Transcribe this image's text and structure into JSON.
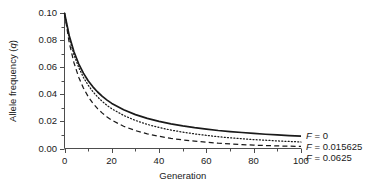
{
  "chart_data": {
    "type": "line",
    "title": "",
    "xlabel": "Generation",
    "ylabel": "Allele frequency (q)",
    "ylabel_prefix": "Allele frequency (",
    "ylabel_italic": "q",
    "ylabel_suffix": ")",
    "xlim": [
      0,
      100
    ],
    "ylim": [
      0.0,
      0.1
    ],
    "xticks": [
      0,
      20,
      40,
      60,
      80,
      100
    ],
    "xtick_labels": [
      "0",
      "20",
      "40",
      "60",
      "80",
      "100"
    ],
    "xminor_step": 10,
    "yticks": [
      0.0,
      0.02,
      0.04,
      0.06,
      0.08,
      0.1
    ],
    "ytick_labels": [
      "0.00",
      "0.02",
      "0.04",
      "0.06",
      "0.08",
      "0.10"
    ],
    "yminor_step": 0.01,
    "grid": false,
    "legend_position": "right-of-axes-at-curve-ends",
    "x": [
      0,
      2,
      4,
      6,
      8,
      10,
      12,
      14,
      16,
      18,
      20,
      25,
      30,
      35,
      40,
      45,
      50,
      55,
      60,
      65,
      70,
      75,
      80,
      85,
      90,
      95,
      100
    ],
    "series": [
      {
        "name": "F = 0",
        "label_prefix": "F",
        "label_rest": " = 0",
        "value": 0,
        "style": "solid",
        "color": "#1a1a1a",
        "values": [
          0.1,
          0.0833,
          0.0714,
          0.0625,
          0.0556,
          0.05,
          0.0455,
          0.0417,
          0.0385,
          0.0357,
          0.0333,
          0.0286,
          0.025,
          0.0222,
          0.02,
          0.0182,
          0.0167,
          0.0154,
          0.0143,
          0.0133,
          0.0125,
          0.0118,
          0.0111,
          0.0105,
          0.01,
          0.0095,
          0.0091
        ]
      },
      {
        "name": "F = 0.015625",
        "label_prefix": "F",
        "label_rest": " = 0.015625",
        "value": 0.015625,
        "style": "dotted",
        "color": "#1a1a1a",
        "values": [
          0.1,
          0.0819,
          0.0692,
          0.0598,
          0.0525,
          0.0467,
          0.042,
          0.038,
          0.0347,
          0.0318,
          0.0293,
          0.0244,
          0.0207,
          0.0178,
          0.0155,
          0.0136,
          0.0121,
          0.0108,
          0.0097,
          0.0087,
          0.0079,
          0.0072,
          0.0066,
          0.0061,
          0.0056,
          0.0052,
          0.0048
        ]
      },
      {
        "name": "F = 0.0625",
        "label_prefix": "F",
        "label_rest": " = 0.0625",
        "value": 0.0625,
        "style": "dashed",
        "color": "#1a1a1a",
        "values": [
          0.1,
          0.0781,
          0.0633,
          0.0526,
          0.0446,
          0.0383,
          0.0334,
          0.0294,
          0.0261,
          0.0233,
          0.0209,
          0.0164,
          0.0132,
          0.0108,
          0.009,
          0.0075,
          0.0063,
          0.0054,
          0.0046,
          0.0039,
          0.0034,
          0.0029,
          0.0025,
          0.0022,
          0.0019,
          0.0017,
          0.0015
        ]
      }
    ]
  },
  "axes": {
    "axis_color": "#4d4d4d",
    "x_title": "Generation",
    "y_title": "Allele frequency (q)"
  }
}
